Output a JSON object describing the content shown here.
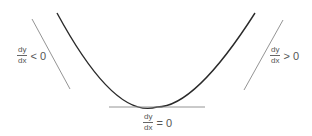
{
  "diagram": {
    "title": "",
    "curve": {
      "shape": "parabola",
      "color": "#2a2a2a"
    },
    "tangent_color": "#888888",
    "labels": {
      "left": {
        "num": "dy",
        "den": "dx",
        "relation": "< 0"
      },
      "bottom": {
        "num": "dy",
        "den": "dx",
        "relation": "= 0"
      },
      "right": {
        "num": "dy",
        "den": "dx",
        "relation": "> 0"
      }
    }
  }
}
